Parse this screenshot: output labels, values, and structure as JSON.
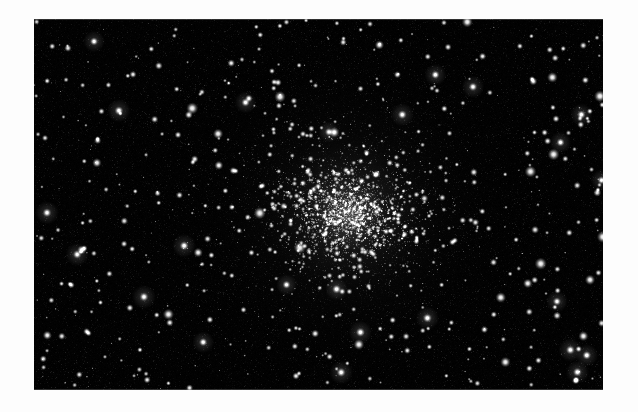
{
  "page": {
    "background_color": "#fdfdfd",
    "width": 638,
    "height": 412,
    "caption": ""
  },
  "figure": {
    "name": "globular-cluster-photograph",
    "frame": {
      "x": 34,
      "y": 19,
      "width": 569,
      "height": 371
    },
    "background_color": "#000000",
    "star_color": "#ffffff",
    "core": {
      "x": 0.552,
      "y": 0.523,
      "glow_opacity": 0.3
    },
    "grain_opacity": 0.3
  },
  "chart_data": {
    "type": "scatter",
    "title": "",
    "subtitle": "",
    "xlabel": "",
    "ylabel": "",
    "grid": false,
    "legend": null,
    "xlim": [
      0,
      1
    ],
    "ylim": [
      0,
      1
    ],
    "annotations": [],
    "core_center": [
      0.552,
      0.523
    ],
    "counts": {
      "cluster_members": 1500,
      "field_stars": 420,
      "bright_field_stars": 190
    },
    "density_profile": {
      "model": "king-like",
      "core_radius_frac": 0.085,
      "tidal_radius_frac": 0.75
    },
    "brightness_scale": {
      "min_radius_px": 0.6,
      "max_radius_px": 4.6
    },
    "series": [
      {
        "name": "cluster members",
        "count": 1500,
        "marker": "gaussian-dot",
        "color": "#ffffff"
      },
      {
        "name": "field stars",
        "count": 420,
        "marker": "gaussian-dot",
        "color": "#f2f2f2"
      },
      {
        "name": "bright field stars",
        "count": 190,
        "marker": "gaussian-dot",
        "color": "#ffffff"
      }
    ]
  },
  "seed": 20240517
}
